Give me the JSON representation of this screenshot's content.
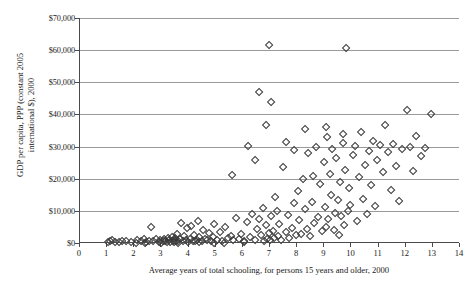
{
  "chart_data": {
    "type": "scatter",
    "title": "",
    "xlabel": "Average years of total schooling, for persons 15 years and older, 2000",
    "ylabel_line1": "GDP per capita, PPP (constant 2005",
    "ylabel_line2": "international $), 2000",
    "xlim": [
      0,
      14
    ],
    "ylim": [
      0,
      70000
    ],
    "xticks": [
      "0",
      "1",
      "2",
      "3",
      "4",
      "5",
      "6",
      "7",
      "8",
      "9",
      "10",
      "11",
      "12",
      "13",
      "14"
    ],
    "xtick_values": [
      0,
      1,
      2,
      3,
      4,
      5,
      6,
      7,
      8,
      9,
      10,
      11,
      12,
      13,
      14
    ],
    "ytick_values": [
      0,
      10000,
      20000,
      30000,
      40000,
      50000,
      60000,
      70000
    ],
    "yticks": [
      "$0",
      "$10,000",
      "$20,000",
      "$30,000",
      "$40,000",
      "$50,000",
      "$60,000",
      "$70,000"
    ],
    "grid": "horizontal",
    "legend": "none",
    "marker": "open-diamond",
    "marker_color": "#3a3a3a",
    "series_name": "countries",
    "points": [
      [
        1.05,
        700
      ],
      [
        1.12,
        850
      ],
      [
        1.2,
        1100
      ],
      [
        1.3,
        600
      ],
      [
        1.45,
        500
      ],
      [
        1.55,
        900
      ],
      [
        1.7,
        750
      ],
      [
        2.1,
        1200
      ],
      [
        2.25,
        800
      ],
      [
        2.35,
        1400
      ],
      [
        2.45,
        650
      ],
      [
        2.55,
        1050
      ],
      [
        2.62,
        5200
      ],
      [
        2.7,
        900
      ],
      [
        2.8,
        1600
      ],
      [
        2.9,
        700
      ],
      [
        2.95,
        1250
      ],
      [
        3.05,
        800
      ],
      [
        3.1,
        1500
      ],
      [
        3.15,
        950
      ],
      [
        3.2,
        600
      ],
      [
        3.25,
        1700
      ],
      [
        3.3,
        1100
      ],
      [
        3.33,
        700
      ],
      [
        3.38,
        2100
      ],
      [
        3.42,
        850
      ],
      [
        3.45,
        1350
      ],
      [
        3.48,
        500
      ],
      [
        3.52,
        1900
      ],
      [
        3.55,
        1000
      ],
      [
        3.58,
        3100
      ],
      [
        3.62,
        750
      ],
      [
        3.68,
        1450
      ],
      [
        3.72,
        6400
      ],
      [
        3.78,
        900
      ],
      [
        3.85,
        2400
      ],
      [
        3.9,
        1150
      ],
      [
        3.95,
        4900
      ],
      [
        4.0,
        700
      ],
      [
        4.05,
        1600
      ],
      [
        4.1,
        5600
      ],
      [
        4.15,
        1000
      ],
      [
        4.2,
        2900
      ],
      [
        4.25,
        800
      ],
      [
        4.3,
        1350
      ],
      [
        4.35,
        7200
      ],
      [
        4.4,
        2100
      ],
      [
        4.48,
        950
      ],
      [
        4.55,
        4200
      ],
      [
        4.6,
        1500
      ],
      [
        4.68,
        1100
      ],
      [
        4.75,
        3300
      ],
      [
        4.82,
        800
      ],
      [
        4.9,
        2000
      ],
      [
        4.95,
        6100
      ],
      [
        5.05,
        1250
      ],
      [
        5.15,
        3800
      ],
      [
        5.25,
        900
      ],
      [
        5.35,
        5400
      ],
      [
        5.45,
        1700
      ],
      [
        5.55,
        2600
      ],
      [
        5.65,
        1100
      ],
      [
        5.75,
        8100
      ],
      [
        5.85,
        1400
      ],
      [
        5.95,
        3000
      ],
      [
        6.05,
        1000
      ],
      [
        6.15,
        6800
      ],
      [
        6.25,
        2200
      ],
      [
        6.35,
        9300
      ],
      [
        6.45,
        1300
      ],
      [
        6.52,
        4500
      ],
      [
        6.6,
        7600
      ],
      [
        6.68,
        2800
      ],
      [
        6.75,
        11200
      ],
      [
        6.8,
        900
      ],
      [
        6.85,
        5900
      ],
      [
        6.9,
        1600
      ],
      [
        6.95,
        3400
      ],
      [
        6.98,
        62000
      ],
      [
        7.02,
        1100
      ],
      [
        7.05,
        8800
      ],
      [
        7.1,
        4000
      ],
      [
        7.15,
        1900
      ],
      [
        7.2,
        14500
      ],
      [
        7.25,
        10300
      ],
      [
        7.3,
        2500
      ],
      [
        7.35,
        6200
      ],
      [
        7.42,
        1300
      ],
      [
        7.5,
        23800
      ],
      [
        7.58,
        3600
      ],
      [
        7.65,
        9000
      ],
      [
        7.72,
        1800
      ],
      [
        7.8,
        5100
      ],
      [
        7.88,
        12600
      ],
      [
        7.95,
        2900
      ],
      [
        8.02,
        16400
      ],
      [
        8.08,
        7400
      ],
      [
        8.15,
        3200
      ],
      [
        8.22,
        20100
      ],
      [
        8.28,
        10800
      ],
      [
        8.35,
        4700
      ],
      [
        8.42,
        28300
      ],
      [
        8.48,
        2400
      ],
      [
        8.55,
        13100
      ],
      [
        8.62,
        6600
      ],
      [
        8.7,
        30100
      ],
      [
        8.78,
        8300
      ],
      [
        8.85,
        18600
      ],
      [
        8.92,
        3900
      ],
      [
        8.98,
        25400
      ],
      [
        9.02,
        11500
      ],
      [
        9.05,
        5300
      ],
      [
        9.1,
        33200
      ],
      [
        9.15,
        7900
      ],
      [
        9.2,
        21700
      ],
      [
        9.25,
        15200
      ],
      [
        9.3,
        29600
      ],
      [
        9.35,
        4300
      ],
      [
        9.4,
        9700
      ],
      [
        9.45,
        26800
      ],
      [
        9.5,
        13800
      ],
      [
        9.55,
        2700
      ],
      [
        9.58,
        19400
      ],
      [
        9.62,
        8600
      ],
      [
        9.68,
        31500
      ],
      [
        9.72,
        6000
      ],
      [
        9.78,
        23100
      ],
      [
        9.82,
        61000
      ],
      [
        9.88,
        10100
      ],
      [
        9.92,
        17300
      ],
      [
        9.96,
        12200
      ],
      [
        10.05,
        27600
      ],
      [
        10.12,
        30400
      ],
      [
        10.2,
        7100
      ],
      [
        10.28,
        20800
      ],
      [
        10.35,
        34800
      ],
      [
        10.42,
        14100
      ],
      [
        10.5,
        24600
      ],
      [
        10.58,
        9400
      ],
      [
        10.65,
        29000
      ],
      [
        10.72,
        18200
      ],
      [
        10.8,
        31900
      ],
      [
        10.88,
        11800
      ],
      [
        10.95,
        26200
      ],
      [
        11.05,
        30800
      ],
      [
        11.15,
        22300
      ],
      [
        11.25,
        36900
      ],
      [
        11.35,
        28700
      ],
      [
        11.45,
        16800
      ],
      [
        11.55,
        31200
      ],
      [
        11.65,
        24100
      ],
      [
        11.75,
        13400
      ],
      [
        11.85,
        29400
      ],
      [
        12.05,
        41800
      ],
      [
        12.15,
        30200
      ],
      [
        12.28,
        22600
      ],
      [
        12.4,
        33600
      ],
      [
        12.55,
        27200
      ],
      [
        12.7,
        29800
      ],
      [
        12.95,
        40300
      ],
      [
        6.6,
        47200
      ],
      [
        7.05,
        44000
      ],
      [
        6.85,
        37000
      ],
      [
        8.3,
        35900
      ],
      [
        9.05,
        36400
      ],
      [
        9.7,
        34100
      ],
      [
        5.6,
        21400
      ],
      [
        6.2,
        30500
      ],
      [
        6.45,
        26000
      ],
      [
        7.6,
        31800
      ],
      [
        7.9,
        29200
      ],
      [
        8.6,
        21000
      ],
      [
        2.4,
        300
      ],
      [
        2.05,
        420
      ],
      [
        1.9,
        560
      ],
      [
        4.95,
        430
      ],
      [
        5.3,
        380
      ],
      [
        6.05,
        450
      ],
      [
        3.0,
        350
      ],
      [
        3.6,
        400
      ],
      [
        4.4,
        520
      ]
    ]
  }
}
